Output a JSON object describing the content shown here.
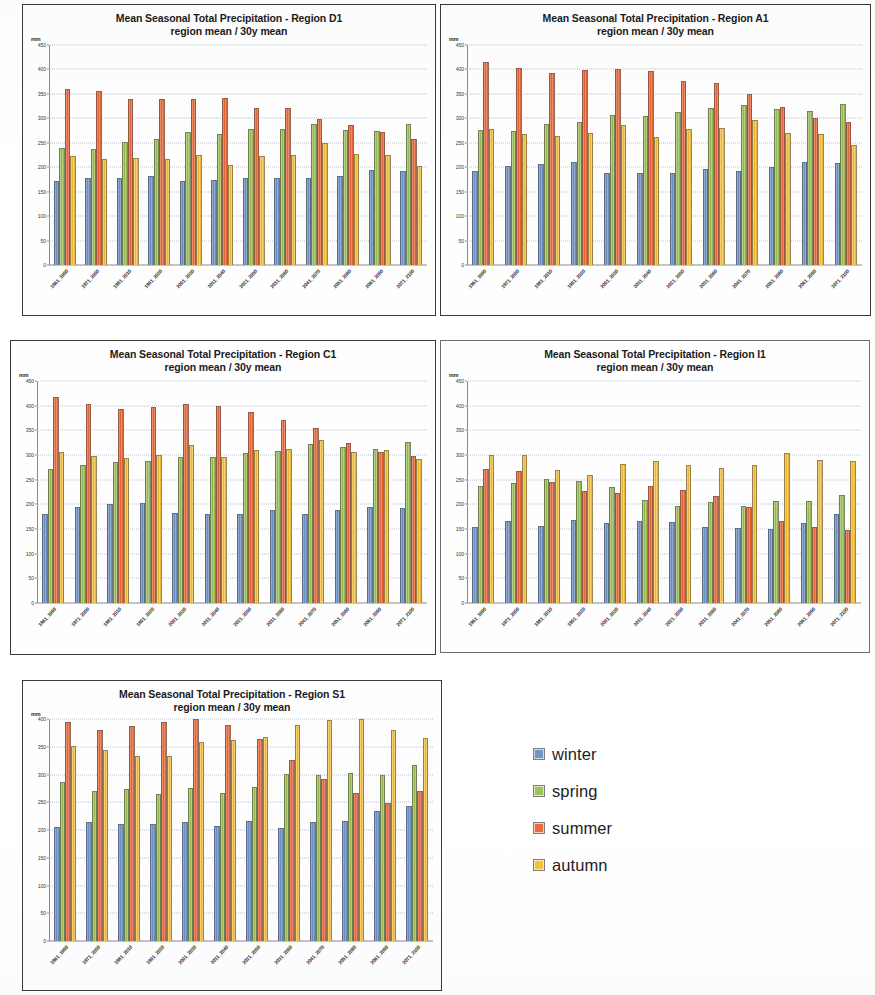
{
  "figure": {
    "unit_label": "mm",
    "subtitle": "region mean / 30y mean",
    "title_prefix": "Mean Seasonal Total Precipitation - Region "
  },
  "legend": {
    "items": [
      {
        "label": "winter",
        "color": "#7093c8",
        "icon": "square-swatch-icon"
      },
      {
        "label": "spring",
        "color": "#9fc159",
        "icon": "square-swatch-icon"
      },
      {
        "label": "summer",
        "color": "#eb6a3b",
        "icon": "square-swatch-icon"
      },
      {
        "label": "autumn",
        "color": "#f5c13f",
        "icon": "square-swatch-icon"
      }
    ]
  },
  "panels": [
    {
      "id": "D1",
      "title": "Mean Seasonal Total Precipitation - Region D1"
    },
    {
      "id": "A1",
      "title": "Mean Seasonal Total Precipitation - Region A1"
    },
    {
      "id": "C1",
      "title": "Mean Seasonal Total Precipitation - Region C1"
    },
    {
      "id": "I1",
      "title": "Mean Seasonal Total Precipitation - Region I1"
    },
    {
      "id": "S1",
      "title": "Mean Seasonal Total Precipitation - Region S1"
    }
  ],
  "chart_data": [
    {
      "type": "bar",
      "panel_id": "D1",
      "title": "Mean Seasonal Total Precipitation - Region D1",
      "subtitle": "region mean / 30y mean",
      "xlabel": "",
      "ylabel": "mm",
      "ylim": [
        0,
        450
      ],
      "yticks": [
        0,
        50,
        100,
        150,
        200,
        250,
        300,
        350,
        400,
        450
      ],
      "grid": true,
      "legend_position": "external-right",
      "categories": [
        "1961_1990",
        "1971_2000",
        "1981_2010",
        "1991_2020",
        "2001_2030",
        "2011_2040",
        "2021_2050",
        "2031_2060",
        "2041_2070",
        "2051_2080",
        "2061_2090",
        "2071_2100"
      ],
      "series": [
        {
          "name": "winter",
          "color": "#7093c8",
          "values": [
            171,
            177,
            178,
            182,
            172,
            174,
            177,
            177,
            178,
            182,
            194,
            192
          ]
        },
        {
          "name": "spring",
          "color": "#9fc159",
          "values": [
            239,
            238,
            252,
            257,
            272,
            268,
            278,
            278,
            289,
            276,
            275,
            289
          ]
        },
        {
          "name": "summer",
          "color": "#eb6a3b",
          "values": [
            361,
            355,
            339,
            340,
            340,
            341,
            322,
            322,
            298,
            287,
            272,
            258
          ]
        },
        {
          "name": "autumn",
          "color": "#f5c13f",
          "values": [
            223,
            217,
            218,
            216,
            226,
            204,
            223,
            226,
            249,
            228,
            226,
            203
          ]
        }
      ]
    },
    {
      "type": "bar",
      "panel_id": "A1",
      "title": "Mean Seasonal Total Precipitation - Region A1",
      "subtitle": "region mean / 30y mean",
      "xlabel": "",
      "ylabel": "mm",
      "ylim": [
        0,
        450
      ],
      "yticks": [
        0,
        50,
        100,
        150,
        200,
        250,
        300,
        350,
        400,
        450
      ],
      "grid": true,
      "legend_position": "external-right",
      "categories": [
        "1961_1990",
        "1971_2000",
        "1981_2010",
        "1991_2020",
        "2001_2030",
        "2011_2040",
        "2021_2050",
        "2031_2060",
        "2041_2070",
        "2051_2080",
        "2061_2090",
        "2071_2100"
      ],
      "series": [
        {
          "name": "winter",
          "color": "#7093c8",
          "values": [
            192,
            203,
            207,
            210,
            188,
            188,
            189,
            197,
            192,
            201,
            211,
            208
          ]
        },
        {
          "name": "spring",
          "color": "#9fc159",
          "values": [
            276,
            274,
            288,
            293,
            306,
            304,
            314,
            322,
            327,
            320,
            316,
            330
          ]
        },
        {
          "name": "summer",
          "color": "#eb6a3b",
          "values": [
            416,
            403,
            392,
            398,
            401,
            397,
            377,
            372,
            350,
            324,
            301,
            292
          ]
        },
        {
          "name": "autumn",
          "color": "#f5c13f",
          "values": [
            279,
            268,
            263,
            270,
            287,
            261,
            279,
            281,
            297,
            271,
            267,
            245
          ]
        }
      ]
    },
    {
      "type": "bar",
      "panel_id": "C1",
      "title": "Mean Seasonal Total Precipitation - Region C1",
      "subtitle": "region mean / 30y mean",
      "xlabel": "",
      "ylabel": "mm",
      "ylim": [
        0,
        450
      ],
      "yticks": [
        0,
        50,
        100,
        150,
        200,
        250,
        300,
        350,
        400,
        450
      ],
      "grid": true,
      "legend_position": "external-right",
      "categories": [
        "1961_1990",
        "1971_2000",
        "1981_2010",
        "1991_2020",
        "2001_2030",
        "2011_2040",
        "2021_2050",
        "2031_2060",
        "2041_2070",
        "2051_2080",
        "2061_2090",
        "2071_2100"
      ],
      "series": [
        {
          "name": "winter",
          "color": "#7093c8",
          "values": [
            180,
            194,
            201,
            203,
            182,
            180,
            180,
            189,
            180,
            188,
            195,
            193
          ]
        },
        {
          "name": "spring",
          "color": "#9fc159",
          "values": [
            272,
            279,
            286,
            288,
            296,
            296,
            305,
            308,
            322,
            316,
            313,
            326
          ]
        },
        {
          "name": "summer",
          "color": "#eb6a3b",
          "values": [
            418,
            403,
            393,
            397,
            404,
            399,
            387,
            371,
            355,
            324,
            306,
            297
          ]
        },
        {
          "name": "autumn",
          "color": "#f5c13f",
          "values": [
            306,
            297,
            294,
            301,
            320,
            296,
            311,
            313,
            330,
            307,
            311,
            292
          ]
        }
      ]
    },
    {
      "type": "bar",
      "panel_id": "I1",
      "title": "Mean Seasonal Total Precipitation - Region I1",
      "subtitle": "region mean / 30y mean",
      "xlabel": "",
      "ylabel": "mm",
      "ylim": [
        0,
        450
      ],
      "yticks": [
        0,
        50,
        100,
        150,
        200,
        250,
        300,
        350,
        400,
        450
      ],
      "grid": true,
      "legend_position": "external-right",
      "categories": [
        "1961_1990",
        "1971_2000",
        "1981_2010",
        "1991_2020",
        "2001_2030",
        "2011_2040",
        "2021_2050",
        "2031_2060",
        "2041_2070",
        "2051_2080",
        "2061_2090",
        "2071_2100"
      ],
      "series": [
        {
          "name": "winter",
          "color": "#7093c8",
          "values": [
            154,
            167,
            156,
            169,
            163,
            167,
            164,
            155,
            153,
            151,
            163,
            181
          ]
        },
        {
          "name": "spring",
          "color": "#9fc159",
          "values": [
            238,
            243,
            251,
            247,
            236,
            208,
            196,
            205,
            197,
            206,
            206,
            218
          ]
        },
        {
          "name": "summer",
          "color": "#eb6a3b",
          "values": [
            272,
            268,
            246,
            228,
            224,
            238,
            230,
            217,
            194,
            166,
            154,
            147
          ]
        },
        {
          "name": "autumn",
          "color": "#f5c13f",
          "values": [
            300,
            300,
            269,
            259,
            281,
            287,
            279,
            273,
            280,
            304,
            289,
            287
          ]
        }
      ]
    },
    {
      "type": "bar",
      "panel_id": "S1",
      "title": "Mean Seasonal Total Precipitation - Region S1",
      "subtitle": "region mean / 30y mean",
      "xlabel": "",
      "ylabel": "mm",
      "ylim": [
        0,
        400
      ],
      "yticks": [
        0,
        50,
        100,
        150,
        200,
        250,
        300,
        350,
        400
      ],
      "grid": true,
      "legend_position": "external-right",
      "categories": [
        "1961_1990",
        "1971_2000",
        "1981_2010",
        "1991_2020",
        "2001_2030",
        "2011_2040",
        "2021_2050",
        "2031_2060",
        "2041_2070",
        "2051_2080",
        "2061_2090",
        "2071_2100"
      ],
      "series": [
        {
          "name": "winter",
          "color": "#7093c8",
          "values": [
            205,
            214,
            210,
            211,
            214,
            208,
            216,
            203,
            215,
            216,
            235,
            244
          ]
        },
        {
          "name": "spring",
          "color": "#9fc159",
          "values": [
            286,
            271,
            274,
            265,
            275,
            267,
            278,
            301,
            299,
            302,
            300,
            317
          ]
        },
        {
          "name": "summer",
          "color": "#eb6a3b",
          "values": [
            394,
            380,
            387,
            394,
            401,
            389,
            364,
            327,
            292,
            266,
            248,
            271
          ]
        },
        {
          "name": "autumn",
          "color": "#f5c13f",
          "values": [
            351,
            344,
            334,
            334,
            359,
            362,
            367,
            389,
            399,
            403,
            380,
            366
          ]
        }
      ]
    }
  ]
}
